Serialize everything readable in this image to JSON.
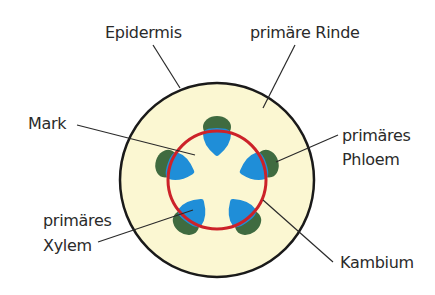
{
  "diagram": {
    "labels": {
      "epidermis": "Epidermis",
      "rinde": "primäre Rinde",
      "mark": "Mark",
      "phloem_line1": "primäres",
      "phloem_line2": "Phloem",
      "xylem_line1": "primäres",
      "xylem_line2": "Xylem",
      "kambium": "Kambium"
    },
    "colors": {
      "cortex": "#fbf7d2",
      "outline": "#1a1a1a",
      "cambium": "#cc2229",
      "phloem": "#3f6b40",
      "xylem": "#1f8ed8",
      "leader": "#2a2a2a"
    },
    "bundle_count": 5
  }
}
